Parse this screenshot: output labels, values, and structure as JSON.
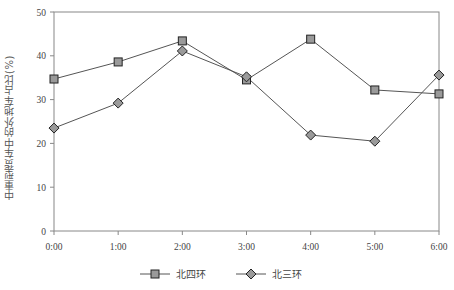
{
  "chart_data": {
    "type": "line",
    "title": "",
    "xlabel": "",
    "ylabel": "中重型货车中的外地车占比(%)",
    "categories": [
      "0:00",
      "1:00",
      "2:00",
      "3:00",
      "4:00",
      "5:00",
      "6:00"
    ],
    "series": [
      {
        "name": "北四环",
        "marker": "square",
        "values": [
          34.7,
          38.6,
          43.4,
          34.5,
          43.8,
          32.2,
          31.3
        ]
      },
      {
        "name": "北三环",
        "marker": "diamond",
        "values": [
          23.5,
          29.2,
          41.1,
          35.2,
          21.9,
          20.5,
          35.6
        ]
      }
    ],
    "ylim": [
      0,
      50
    ],
    "yticks": [
      0,
      10,
      20,
      30,
      40,
      50
    ],
    "grid": false,
    "legend_position": "bottom"
  },
  "colors": {
    "marker_fill": "#9a9a9a",
    "marker_stroke": "#222222",
    "line": "#555555",
    "axis": "#888888"
  }
}
